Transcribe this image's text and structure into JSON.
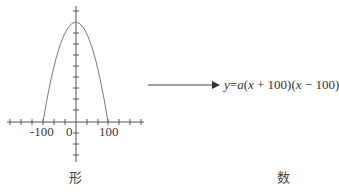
{
  "graph": {
    "x_tick_labels": [
      "-100",
      "0",
      "100"
    ],
    "caption": "形",
    "curve": {
      "type": "parabola",
      "roots": [
        -100,
        100
      ],
      "opens": "down"
    },
    "stroke_color": "#555555",
    "curve_color": "#7a7a7a"
  },
  "arrow": {
    "direction": "right"
  },
  "formula": {
    "text": "y = a(x + 100)(x − 100)",
    "parts": {
      "y": "y",
      "eq": "=",
      "a": "a",
      "lp1": "(",
      "x1": "x",
      "plus": " + 100)",
      "lp2": "(",
      "x2": "x",
      "minus": " − 100)"
    },
    "caption": "数"
  }
}
